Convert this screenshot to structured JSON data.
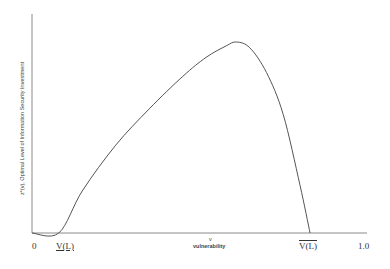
{
  "chart_data": {
    "type": "line",
    "title": "",
    "xlabel_symbol": "v",
    "xlabel": "vulnerability",
    "ylabel": "z*(v), Optimal Level of Information Security Investment",
    "xlim": [
      0,
      1.0
    ],
    "grid": false,
    "legend": null,
    "x_ticks": [
      "0",
      "V(L)",
      "V(L)",
      "1.0"
    ],
    "x_tick_notes": [
      "origin",
      "lower bound V(L) (underlined V)",
      "upper bound V(L) (V with overbar)",
      "max"
    ],
    "annotations": {
      "lower_bound_label": "V(L)",
      "upper_bound_label": "V(L)",
      "lower_bound_v": 0.08,
      "upper_bound_v": 0.83,
      "peak_v": 0.61
    },
    "series": [
      {
        "name": "z*(v)",
        "x": [
          0.0,
          0.08,
          0.15,
          0.25,
          0.35,
          0.45,
          0.52,
          0.58,
          0.61,
          0.65,
          0.7,
          0.75,
          0.8,
          0.83
        ],
        "y": [
          0.0,
          0.0,
          0.22,
          0.46,
          0.65,
          0.82,
          0.92,
          0.98,
          1.0,
          0.97,
          0.84,
          0.62,
          0.25,
          0.0
        ]
      }
    ]
  },
  "labels": {
    "origin": "0",
    "max": "1.0",
    "lower": "V(L)",
    "upper": "V(L)",
    "v_symbol": "v",
    "x_title": "vulnerability",
    "y_title": "z*(v), Optimal Level of Information Security Investment"
  }
}
